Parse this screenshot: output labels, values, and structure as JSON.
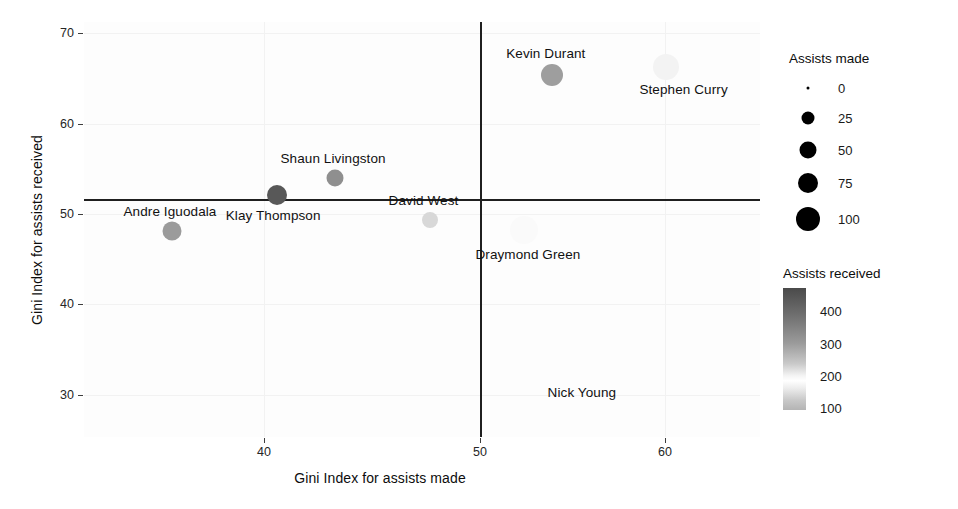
{
  "chart_data": {
    "type": "scatter",
    "title": "",
    "xlabel": "Gini Index for assists made",
    "ylabel": "Gini Index for assists received",
    "xlim": [
      33.5,
      65.0
    ],
    "ylim": [
      25.5,
      71.5
    ],
    "xticks": [
      "40",
      "50",
      "60"
    ],
    "yticks": [
      "70",
      "60",
      "50",
      "40",
      "30"
    ],
    "grid": true,
    "reference_lines": {
      "horizontal_y": 51.7,
      "vertical_x": 50.2
    },
    "points": [
      {
        "label": "Kevin Durant",
        "x": 55.3,
        "y": 65.6,
        "assists_made": 72,
        "assists_received": 300,
        "color": "#9e9e9e",
        "size_px": 22,
        "label_dx": -6,
        "label_dy": -22
      },
      {
        "label": "Stephen Curry",
        "x": 60.6,
        "y": 66.5,
        "assists_made": 95,
        "assists_received": 190,
        "color": "#f3f3f3",
        "size_px": 26,
        "label_dx": 18,
        "label_dy": 22
      },
      {
        "label": "Shaun Livingston",
        "x": 45.2,
        "y": 54.2,
        "assists_made": 40,
        "assists_received": 330,
        "color": "#8f8f8f",
        "size_px": 17,
        "label_dx": -2,
        "label_dy": -20
      },
      {
        "label": "Klay Thompson",
        "x": 42.5,
        "y": 52.3,
        "assists_made": 52,
        "assists_received": 430,
        "color": "#585858",
        "size_px": 20,
        "label_dx": -4,
        "label_dy": 20
      },
      {
        "label": "David West",
        "x": 49.6,
        "y": 49.6,
        "assists_made": 38,
        "assists_received": 215,
        "color": "#d8d8d8",
        "size_px": 16,
        "label_dx": -6,
        "label_dy": -20
      },
      {
        "label": "Andre Iguodala",
        "x": 37.6,
        "y": 48.3,
        "assists_made": 46,
        "assists_received": 320,
        "color": "#9b9b9b",
        "size_px": 19,
        "label_dx": -2,
        "label_dy": -20
      },
      {
        "label": "Draymond Green",
        "x": 54.0,
        "y": 48.5,
        "assists_made": 100,
        "assists_received": 150,
        "color": "#fafafa",
        "size_px": 28,
        "label_dx": 4,
        "label_dy": 24
      },
      {
        "label": "Nick Young",
        "x": 56.7,
        "y": 30.5,
        "assists_made": 8,
        "assists_received": 120,
        "color": "#fcfcfc",
        "size_px": 7,
        "label_dx": 0,
        "label_dy": 0
      }
    ]
  },
  "legends": {
    "size": {
      "title": "Assists made",
      "keys": [
        {
          "label": "0",
          "dot_px": 3
        },
        {
          "label": "25",
          "dot_px": 13
        },
        {
          "label": "50",
          "dot_px": 17
        },
        {
          "label": "75",
          "dot_px": 20
        },
        {
          "label": "100",
          "dot_px": 24
        }
      ]
    },
    "color": {
      "title": "Assists received",
      "ticks": [
        "400",
        "300",
        "200",
        "100"
      ]
    }
  },
  "colors": {
    "axis_text": "#262626",
    "refline": "#1f1f1f",
    "panel_bg": "#fdfdfd",
    "gridline": "#f2f2f2",
    "colorbar_high": "#4a4a4a",
    "colorbar_low": "#ffffff"
  }
}
